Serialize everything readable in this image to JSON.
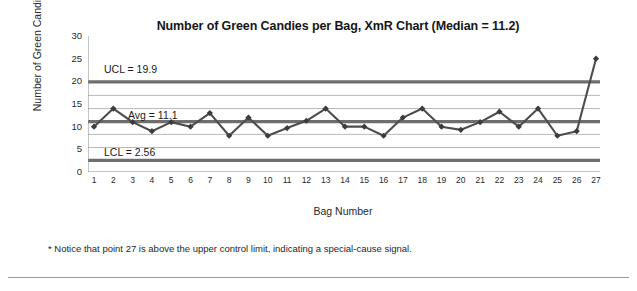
{
  "chart_data": {
    "type": "line",
    "title": "Number of Green Candies per Bag, XmR Chart (Median = 11.2)",
    "xlabel": "Bag Number",
    "ylabel": "Number of Green Candies",
    "categories": [
      1,
      2,
      3,
      4,
      5,
      6,
      7,
      8,
      9,
      10,
      11,
      12,
      13,
      14,
      15,
      16,
      17,
      18,
      19,
      20,
      21,
      22,
      23,
      24,
      25,
      26,
      27
    ],
    "values": [
      10,
      14,
      11,
      9,
      11,
      10,
      13,
      8,
      12,
      8,
      9.7,
      11.3,
      14,
      10,
      10,
      8,
      12,
      14,
      10,
      9.3,
      11,
      13.3,
      10,
      14,
      8,
      9,
      25
    ],
    "series": [
      {
        "name": "Number of Green Candies",
        "values": [
          10,
          14,
          11,
          9,
          11,
          10,
          13,
          8,
          12,
          8,
          9.7,
          11.3,
          14,
          10,
          10,
          8,
          12,
          14,
          10,
          9.3,
          11,
          13.3,
          10,
          14,
          8,
          9,
          25
        ]
      }
    ],
    "ylim": [
      0,
      30
    ],
    "yticks": [
      0,
      5,
      10,
      15,
      20,
      25,
      30
    ],
    "xlim": [
      1,
      27
    ],
    "grid": true,
    "legend": "none",
    "control_limits": {
      "ucl": 19.9,
      "avg": 11.1,
      "lcl": 2.56,
      "median": 11.2
    },
    "gridlines": [
      2.56,
      5.4,
      8.3,
      11.1,
      14.0,
      16.9,
      19.9
    ],
    "annotations": [
      {
        "name": "ucl-label",
        "text": "UCL = 19.9",
        "value": 19.9
      },
      {
        "name": "avg-label",
        "text": "Avg = 11.1",
        "value": 11.1
      },
      {
        "name": "lcl-label",
        "text": "LCL = 2.56",
        "value": 2.56
      }
    ],
    "colors": {
      "series_line": "#4d4d4d",
      "marker": "#3c3c3c",
      "control_line": "#6e6e6e",
      "gridline": "#b9b9b9",
      "axis": "#8a8a8a",
      "text": "#1a1a1a"
    }
  },
  "footnote": {
    "text": "* Notice that point 27 is above the upper control limit, indicating a special-cause signal."
  }
}
